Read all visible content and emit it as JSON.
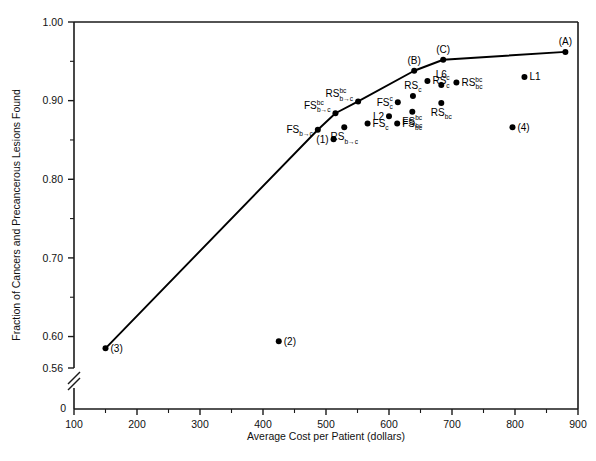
{
  "chart_data": {
    "type": "scatter",
    "title": "",
    "xlabel": "Average Cost per Patient (dollars)",
    "ylabel": "Fraction of Cancers and Precancerous Lesions Found",
    "xlim": [
      100,
      900
    ],
    "ylim": [
      0.56,
      1.0
    ],
    "grid": false,
    "legend": "none",
    "axis_break_y": true,
    "x_ticks": [
      100,
      200,
      300,
      400,
      500,
      600,
      700,
      800,
      900
    ],
    "x_tick_labels": [
      "100",
      "200",
      "300",
      "400",
      "500",
      "600",
      "700",
      "800",
      "900"
    ],
    "x_minor_ticks": [
      150,
      250,
      350,
      450,
      550,
      650,
      750,
      850
    ],
    "y_ticks": [
      1.0,
      0.9,
      0.8,
      0.7,
      0.6,
      0.56
    ],
    "y_tick_labels": [
      "1.00",
      "0.90",
      "0.80",
      "0.70",
      "0.60",
      "0.56"
    ],
    "y_minor_ticks": [
      0.95,
      0.85,
      0.75,
      0.65
    ],
    "y_origin_label": "0",
    "frontier": {
      "name": "Efficient frontier",
      "points": [
        {
          "x": 150,
          "y": 0.585
        },
        {
          "x": 487,
          "y": 0.863
        },
        {
          "x": 515,
          "y": 0.884
        },
        {
          "x": 551,
          "y": 0.899
        },
        {
          "x": 640,
          "y": 0.938
        },
        {
          "x": 686,
          "y": 0.952
        },
        {
          "x": 880,
          "y": 0.962
        }
      ]
    },
    "points": [
      {
        "label": "(3)",
        "x": 150,
        "y": 0.585,
        "label_pos": "right",
        "on_frontier": true
      },
      {
        "label": "FS_b→c",
        "base": "FS",
        "sup": "",
        "sub": "b→c",
        "x": 487,
        "y": 0.863,
        "label_pos": "left",
        "on_frontier": true
      },
      {
        "label": "FS^bc_b→c",
        "base": "FS",
        "sup": "bc",
        "sub": "b→c",
        "x": 515,
        "y": 0.884,
        "label_pos": "upleft",
        "on_frontier": true
      },
      {
        "label": "RS^bc_b→c",
        "base": "RS",
        "sup": "bc",
        "sub": "b→c",
        "x": 551,
        "y": 0.899,
        "label_pos": "upleft",
        "on_frontier": true
      },
      {
        "label": "(B)",
        "x": 640,
        "y": 0.938,
        "label_pos": "above",
        "on_frontier": true
      },
      {
        "label": "(C)",
        "x": 686,
        "y": 0.952,
        "label_pos": "above",
        "on_frontier": true
      },
      {
        "label": "(A)",
        "x": 880,
        "y": 0.962,
        "label_pos": "above",
        "on_frontier": true
      },
      {
        "label": "(1)",
        "x": 512,
        "y": 0.851,
        "label_pos": "left",
        "on_frontier": false
      },
      {
        "label": "RS_b→c",
        "base": "RS",
        "sup": "",
        "sub": "b→c",
        "x": 529,
        "y": 0.866,
        "label_pos": "below",
        "on_frontier": false
      },
      {
        "label": "FS_c",
        "base": "FS",
        "sup": "",
        "sub": "c",
        "x": 566,
        "y": 0.871,
        "label_pos": "right",
        "on_frontier": false
      },
      {
        "label": "L2",
        "x": 600,
        "y": 0.88,
        "label_pos": "left",
        "on_frontier": false
      },
      {
        "label": "FS_bc",
        "base": "FS",
        "sup": "",
        "sub": "bc",
        "x": 613,
        "y": 0.871,
        "label_pos": "right",
        "on_frontier": false
      },
      {
        "label": "FS^c_c",
        "base": "FS",
        "sup": "c",
        "sub": "c",
        "x": 614,
        "y": 0.898,
        "label_pos": "left",
        "on_frontier": false
      },
      {
        "label": "FS^bc_bc",
        "base": "FS",
        "sup": "bc",
        "sub": "bc",
        "x": 637,
        "y": 0.886,
        "label_pos": "below",
        "on_frontier": false
      },
      {
        "label": "RS_c",
        "base": "RS",
        "sup": "",
        "sub": "c",
        "x": 638,
        "y": 0.906,
        "label_pos": "above",
        "on_frontier": false
      },
      {
        "label": "RS^c_c",
        "base": "RS",
        "sup": "c",
        "sub": "c",
        "x": 661,
        "y": 0.925,
        "label_pos": "right",
        "on_frontier": false
      },
      {
        "label": "L6",
        "x": 683,
        "y": 0.92,
        "label_pos": "above",
        "on_frontier": false
      },
      {
        "label": "RS_bc",
        "base": "RS",
        "sup": "",
        "sub": "bc",
        "x": 683,
        "y": 0.897,
        "label_pos": "below",
        "on_frontier": false
      },
      {
        "label": "RS^bc_bc",
        "base": "RS",
        "sup": "bc",
        "sub": "bc",
        "x": 707,
        "y": 0.923,
        "label_pos": "right",
        "on_frontier": false
      },
      {
        "label": "L1",
        "x": 815,
        "y": 0.93,
        "label_pos": "right",
        "on_frontier": false
      },
      {
        "label": "(4)",
        "x": 796,
        "y": 0.866,
        "label_pos": "right",
        "on_frontier": false
      },
      {
        "label": "(2)",
        "x": 425,
        "y": 0.594,
        "label_pos": "right",
        "on_frontier": false
      }
    ]
  }
}
